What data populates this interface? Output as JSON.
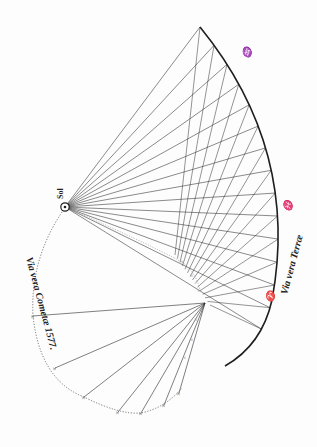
{
  "figure": {
    "labels": {
      "sun": "Sol",
      "earth_path": "Via vera Terræ",
      "comet_path": "Via vera Cometæ 1577."
    },
    "symbols": {
      "aquarius": "♒",
      "pisces": "♓",
      "aries": "♈"
    },
    "colors": {
      "ink": "#2a2a2a",
      "faint": "#8a8a8a",
      "paper": "#fdfdfd"
    },
    "earth_sightings": 15,
    "comet_sightings": 10
  }
}
